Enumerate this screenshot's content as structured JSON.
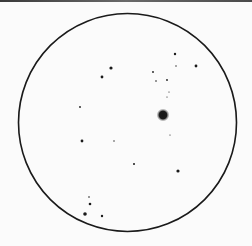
{
  "sketch": {
    "background": "#fbfbfb",
    "ink": "#1a1a1a",
    "field_of_view": {
      "cx": 127.5,
      "cy": 122.5,
      "r": 109,
      "stroke_width": 1.6
    },
    "bright_star": {
      "x": 163,
      "y": 115,
      "r": 4.2,
      "glow": 6.5
    },
    "stars": [
      {
        "x": 175,
        "y": 54,
        "r": 1.2
      },
      {
        "x": 176,
        "y": 66,
        "r": 0.7
      },
      {
        "x": 196,
        "y": 66,
        "r": 1.4
      },
      {
        "x": 153,
        "y": 72,
        "r": 0.9
      },
      {
        "x": 156,
        "y": 81,
        "r": 0.8
      },
      {
        "x": 167,
        "y": 80,
        "r": 0.9
      },
      {
        "x": 169,
        "y": 92,
        "r": 0.6
      },
      {
        "x": 167,
        "y": 97,
        "r": 0.6
      },
      {
        "x": 170,
        "y": 135,
        "r": 0.6
      },
      {
        "x": 111,
        "y": 68,
        "r": 1.6
      },
      {
        "x": 102,
        "y": 77,
        "r": 1.4
      },
      {
        "x": 80,
        "y": 107,
        "r": 0.9
      },
      {
        "x": 82,
        "y": 141,
        "r": 1.4
      },
      {
        "x": 114,
        "y": 141,
        "r": 0.7
      },
      {
        "x": 134,
        "y": 164,
        "r": 1.0
      },
      {
        "x": 178,
        "y": 171,
        "r": 1.6
      },
      {
        "x": 89,
        "y": 197,
        "r": 0.8
      },
      {
        "x": 90,
        "y": 204,
        "r": 1.3
      },
      {
        "x": 85,
        "y": 214,
        "r": 1.8
      },
      {
        "x": 102,
        "y": 216,
        "r": 1.2
      }
    ]
  }
}
